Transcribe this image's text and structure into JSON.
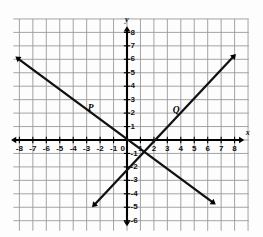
{
  "chart_data": {
    "type": "line",
    "title": "",
    "xlabel": "x",
    "ylabel": "y",
    "xlim": [
      -8.6,
      8.8
    ],
    "ylim": [
      -6.6,
      8.6
    ],
    "grid": true,
    "grid_spacing": 1,
    "legend": "none",
    "x_tick_labels": [
      "-8",
      "-7",
      "-6",
      "-5",
      "-4",
      "-3",
      "-2",
      "-1",
      "0",
      "1",
      "2",
      "3",
      "4",
      "5",
      "6",
      "7",
      "8"
    ],
    "x_tick_values": [
      -8,
      -7,
      -6,
      -5,
      -4,
      -3,
      -2,
      -1,
      0,
      1,
      2,
      3,
      4,
      5,
      6,
      7,
      8
    ],
    "y_tick_labels": [
      "8",
      "7",
      "6",
      "5",
      "4",
      "3",
      "2",
      "1",
      "-1",
      "-2",
      "-3",
      "-4",
      "-5",
      "-6"
    ],
    "y_tick_values": [
      8,
      7,
      6,
      5,
      4,
      3,
      2,
      1,
      -1,
      -2,
      -3,
      -4,
      -5,
      -6
    ],
    "origin_label": "0",
    "series": [
      {
        "name": "P",
        "label": "P",
        "label_at": [
          -2.7,
          2.35
        ],
        "slope": -0.75,
        "intercept": 0.0,
        "x0": -8.3,
        "y0": 6.2,
        "x1": 6.6,
        "y1": -4.8,
        "arrow_start": true,
        "arrow_end": true,
        "color": "#111111"
      },
      {
        "name": "Q",
        "label": "Q",
        "label_at": [
          3.65,
          2.2
        ],
        "slope": 1.07,
        "intercept": -2.1,
        "x0": -2.6,
        "y0": -5.0,
        "x1": 8.1,
        "y1": 6.4,
        "arrow_start": true,
        "arrow_end": true,
        "color": "#111111"
      }
    ],
    "axis_arrows": {
      "x_negative": true,
      "x_positive": true,
      "y_negative": true,
      "y_positive": true
    },
    "colors": {
      "background": "#fdfdfd",
      "grid": "#9a9a9a",
      "axis": "#000000",
      "line": "#111111",
      "text": "#111111"
    }
  }
}
